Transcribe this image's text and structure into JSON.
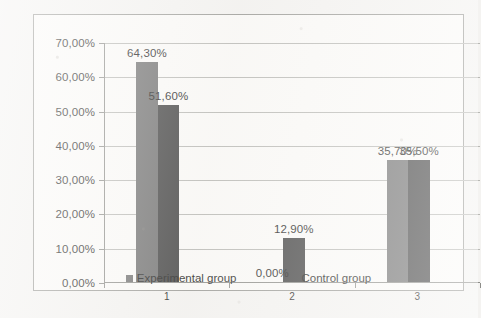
{
  "chart_data": {
    "type": "bar",
    "title": "",
    "subtitle": "",
    "xlabel": "",
    "ylabel": "",
    "categories": [
      "1",
      "2",
      "3"
    ],
    "series": [
      {
        "name": "Experimental group",
        "color": "#6e6e6e",
        "values": [
          64.3,
          0.0,
          35.7
        ],
        "labels": [
          "64,30%",
          "0,00%",
          "35,70%"
        ]
      },
      {
        "name": "Control group",
        "color": "#3f3f3f",
        "values": [
          51.6,
          12.9,
          35.5
        ],
        "labels": [
          "51,60%",
          "12,90%",
          "35,50%"
        ]
      }
    ],
    "ylim": [
      0,
      70
    ],
    "ytick_values": [
      0,
      10,
      20,
      30,
      40,
      50,
      60,
      70
    ],
    "ytick_labels": [
      "0,00%",
      "10,00%",
      "20,00%",
      "30,00%",
      "40,00%",
      "50,00%",
      "60,00%",
      "70,00%"
    ],
    "grid": true,
    "legend_position": "bottom",
    "data_labels_shown": true
  },
  "legend": {
    "items": [
      {
        "label": "Experimental group",
        "color": "#6e6e6e"
      },
      {
        "label": "Control group",
        "color": "#3f3f3f"
      }
    ]
  }
}
